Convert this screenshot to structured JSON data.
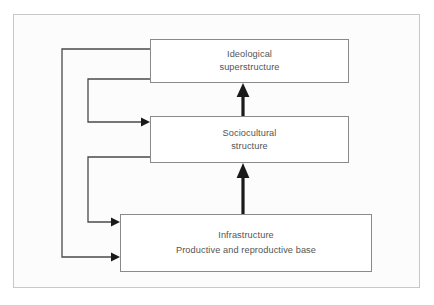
{
  "figure": {
    "background_color": "#ffffff",
    "frame_color": "#c8c8c8",
    "box_border_color": "#8a8a8a",
    "box_fill_color": "#ffffff",
    "text_color": "#545454",
    "arrow_color": "#1a1a1a",
    "feedback_line_color": "#4a4a4a"
  },
  "nodes": [
    {
      "id": "ideological",
      "name": "ideological-superstructure-box",
      "lines": [
        "Ideological",
        "superstructure"
      ]
    },
    {
      "id": "sociocultural",
      "name": "sociocultural-structure-box",
      "lines": [
        "Sociocultural",
        "structure"
      ]
    },
    {
      "id": "infrastructure",
      "name": "infrastructure-box",
      "lines": [
        "Infrastructure",
        "Productive and reproductive base"
      ]
    }
  ],
  "arrows": {
    "upward": [
      {
        "name": "arrow-infrastructure-to-sociocultural",
        "from": "infrastructure",
        "to": "sociocultural",
        "style": "thick-solid-up"
      },
      {
        "name": "arrow-sociocultural-to-ideological",
        "from": "sociocultural",
        "to": "ideological",
        "style": "thick-solid-up"
      }
    ],
    "feedback": [
      {
        "name": "feedback-ideological-to-infrastructure",
        "from": "ideological",
        "to": "infrastructure",
        "style": "thin-routed-left"
      },
      {
        "name": "feedback-ideological-to-sociocultural",
        "from": "ideological",
        "to": "sociocultural",
        "style": "thin-routed-left"
      },
      {
        "name": "feedback-sociocultural-to-infrastructure",
        "from": "sociocultural",
        "to": "infrastructure",
        "style": "thin-routed-left"
      }
    ]
  }
}
